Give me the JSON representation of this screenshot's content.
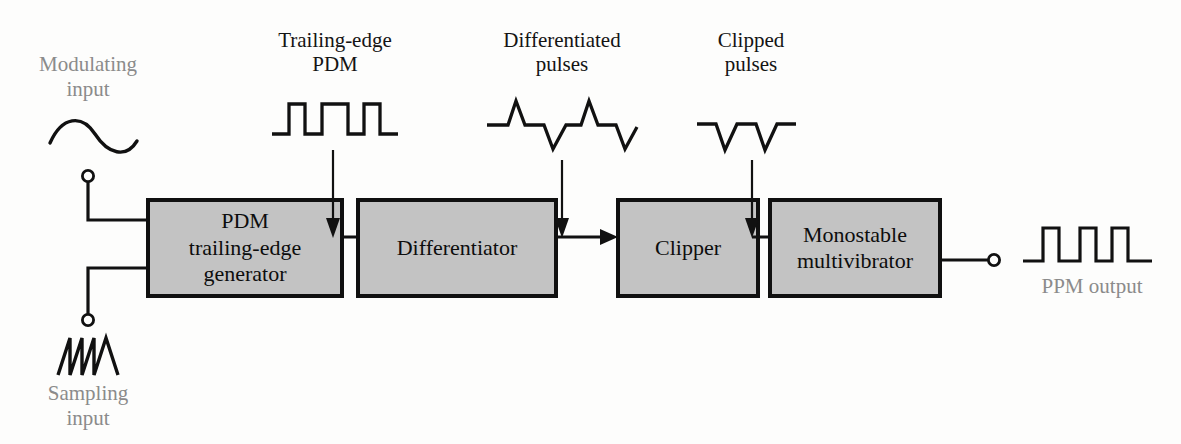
{
  "figure": {
    "type": "block-diagram"
  },
  "inputs": [
    {
      "id": "modulating",
      "label": "Modulating\ninput",
      "waveform": "sine-wave",
      "color": "#8b8b8b"
    },
    {
      "id": "sampling",
      "label": "Sampling\ninput",
      "waveform": "sawtooth-wave",
      "color": "#8b8b8b"
    }
  ],
  "blocks": [
    {
      "id": "pdm-generator",
      "label": "PDM\ntrailing-edge\ngenerator"
    },
    {
      "id": "differentiator",
      "label": "Differentiator"
    },
    {
      "id": "clipper",
      "label": "Clipper"
    },
    {
      "id": "monostable",
      "label": "Monostable\nmultivibrator"
    }
  ],
  "signal_annotations": [
    {
      "id": "trailing-edge-pdm",
      "label": "Trailing-edge\nPDM",
      "waveform": "pdm-pulse-train"
    },
    {
      "id": "differentiated",
      "label": "Differentiated\npulses",
      "waveform": "differentiated-pulses"
    },
    {
      "id": "clipped",
      "label": "Clipped\npulses",
      "waveform": "clipped-pulses"
    }
  ],
  "output": {
    "id": "ppm-output",
    "label": "PPM output",
    "waveform": "ppm-pulse-train",
    "color": "#8b8b8b"
  },
  "colors": {
    "block_fill": "#c3c3c3",
    "block_border": "#101010",
    "line": "#101010",
    "label_gray": "#8b8b8b",
    "label_black": "#141414",
    "background": "#fdfdfc"
  }
}
